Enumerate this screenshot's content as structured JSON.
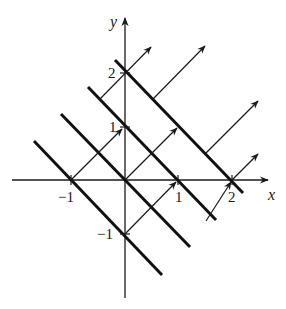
{
  "diagram": {
    "type": "level-curves-with-gradient-vectors",
    "axes": {
      "x_label": "x",
      "y_label": "y",
      "x_ticks": [
        "−1",
        "1",
        "2"
      ],
      "y_ticks": [
        "2",
        "1",
        "−1"
      ]
    },
    "level_lines": [
      {
        "equation": "x + y = -1"
      },
      {
        "equation": "x + y = 0"
      },
      {
        "equation": "x + y = 1"
      },
      {
        "equation": "x + y = 2"
      }
    ],
    "vectors": [
      {
        "from": [
          -1,
          0
        ],
        "to": [
          0,
          1
        ]
      },
      {
        "from": [
          0,
          -1
        ],
        "to": [
          1,
          0
        ]
      },
      {
        "from": [
          0,
          0
        ],
        "to": [
          1,
          1
        ]
      },
      {
        "from": [
          -0.5,
          1.5
        ],
        "to": [
          0.5,
          2.5
        ]
      },
      {
        "from": [
          0.5,
          1.5
        ],
        "to": [
          1.5,
          2.5
        ]
      },
      {
        "from": [
          1.5,
          0.5
        ],
        "to": [
          2.5,
          1.5
        ]
      },
      {
        "from": [
          1.5,
          -0.5
        ],
        "to": [
          2,
          0
        ]
      },
      {
        "from": [
          2,
          0
        ],
        "to": [
          2.5,
          0.5
        ]
      }
    ],
    "colors": {
      "ink": "#1a1a1a",
      "background": "#ffffff"
    }
  }
}
